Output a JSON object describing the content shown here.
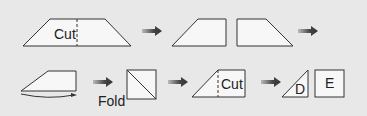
{
  "diagram": {
    "title": "",
    "colors": {
      "background": "#e8e8e8",
      "shape_fill": "#f7f7f7",
      "stroke": "#333333",
      "arrow": "#444444"
    },
    "row1": {
      "step1": {
        "shape": "trapezoid",
        "label": "Cut",
        "cut_line": "dashed-vertical"
      },
      "step2": {
        "shapes": [
          "left-piece",
          "right-piece"
        ]
      }
    },
    "row2": {
      "step3": {
        "shape": "left-piece",
        "motion": "curved-arrow-flip"
      },
      "step4": {
        "shape": "square-with-diagonal",
        "label": "Fold"
      },
      "step5": {
        "shape": "left-piece",
        "label": "Cut",
        "cut_line": "dashed-vertical"
      },
      "step6": {
        "shapes": [
          {
            "shape": "triangle",
            "label": "D"
          },
          {
            "shape": "square",
            "label": "E"
          }
        ]
      }
    }
  }
}
